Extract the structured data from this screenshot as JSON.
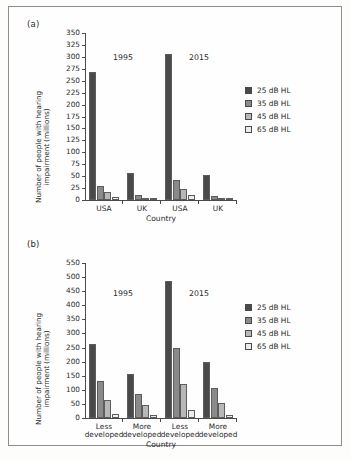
{
  "figure": {
    "panels": [
      {
        "tag": "(a)",
        "ylabel_line1": "Number of people with hearing",
        "ylabel_line2": "impairment (millions)",
        "xlabel": "Country",
        "year_labels": [
          "1995",
          "2015"
        ],
        "legend": [
          {
            "label": "25 dB HL",
            "color": "#4a4a4a"
          },
          {
            "label": "35 dB HL",
            "color": "#8a8a8a"
          },
          {
            "label": "45 dB HL",
            "color": "#b8b8b8"
          },
          {
            "label": "65 dB HL",
            "color": "#ececec"
          }
        ]
      },
      {
        "tag": "(b)",
        "ylabel_line1": "Number of people with hearing",
        "ylabel_line2": "impairment (millions)",
        "xlabel": "Country",
        "year_labels": [
          "1995",
          "2015"
        ],
        "legend": [
          {
            "label": "25 dB HL",
            "color": "#4a4a4a"
          },
          {
            "label": "35 dB HL",
            "color": "#8a8a8a"
          },
          {
            "label": "45 dB HL",
            "color": "#b8b8b8"
          },
          {
            "label": "65 dB HL",
            "color": "#ececec"
          }
        ]
      }
    ]
  },
  "chart_data": [
    {
      "type": "bar",
      "panel": "(a)",
      "title": "",
      "xlabel": "Country",
      "ylabel": "Number of people with hearing impairment (millions)",
      "ylim": [
        0,
        350
      ],
      "yticks": [
        0,
        25,
        50,
        75,
        100,
        125,
        150,
        175,
        200,
        225,
        250,
        275,
        300,
        325,
        350
      ],
      "ytick_labels": [
        "0",
        "25",
        "50",
        "75",
        "100",
        "125",
        "150",
        "175",
        "200",
        "225",
        "250",
        "275",
        "300",
        "325",
        "350"
      ],
      "grid": false,
      "legend_position": "right",
      "group_annotations": [
        "1995",
        "2015"
      ],
      "categories": [
        "USA",
        "UK",
        "USA",
        "UK"
      ],
      "category_years": [
        "1995",
        "1995",
        "2015",
        "2015"
      ],
      "series": [
        {
          "name": "25 dB HL",
          "color": "#4a4a4a",
          "values": [
            268,
            57,
            306,
            52
          ]
        },
        {
          "name": "35 dB HL",
          "color": "#8a8a8a",
          "values": [
            29,
            10,
            41,
            8
          ]
        },
        {
          "name": "45 dB HL",
          "color": "#b8b8b8",
          "values": [
            17,
            4,
            23,
            4
          ]
        },
        {
          "name": "65 dB HL",
          "color": "#ececec",
          "values": [
            6,
            2,
            10,
            2
          ]
        }
      ]
    },
    {
      "type": "bar",
      "panel": "(b)",
      "title": "",
      "xlabel": "Country",
      "ylabel": "Number of people with hearing impairment (millions)",
      "ylim": [
        0,
        550
      ],
      "yticks": [
        0,
        50,
        100,
        150,
        200,
        250,
        300,
        350,
        400,
        450,
        500,
        550
      ],
      "ytick_labels": [
        "0",
        "50",
        "100",
        "150",
        "200",
        "250",
        "300",
        "350",
        "400",
        "450",
        "500",
        "550"
      ],
      "grid": false,
      "legend_position": "right",
      "group_annotations": [
        "1995",
        "2015"
      ],
      "categories": [
        "Less developed",
        "More developed",
        "Less developed",
        "More developed"
      ],
      "category_years": [
        "1995",
        "1995",
        "2015",
        "2015"
      ],
      "series": [
        {
          "name": "25 dB HL",
          "color": "#4a4a4a",
          "values": [
            264,
            155,
            487,
            198
          ]
        },
        {
          "name": "35 dB HL",
          "color": "#8a8a8a",
          "values": [
            131,
            86,
            247,
            108
          ]
        },
        {
          "name": "45 dB HL",
          "color": "#b8b8b8",
          "values": [
            64,
            45,
            122,
            54
          ]
        },
        {
          "name": "65 dB HL",
          "color": "#ececec",
          "values": [
            16,
            12,
            29,
            12
          ]
        }
      ]
    }
  ]
}
